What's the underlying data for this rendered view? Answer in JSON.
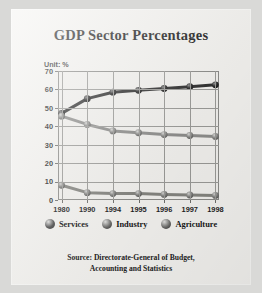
{
  "title": "GDP Sector Percentages",
  "unit_label": "Unit: %",
  "source_line1": "Source: Directorate-General of Budget,",
  "source_line2": "Accounting and Statistics",
  "colors": {
    "services": "#3a3a3a",
    "industry": "#9a9a98",
    "agriculture": "#8a8a88",
    "paper": "#f3f2ef",
    "frame": "#8b8b88",
    "grid": "#9a9a97",
    "text": "#1c1c1c"
  },
  "legend": [
    {
      "label": "Services",
      "color": "#4a4a4a",
      "marker": "sphere-marker"
    },
    {
      "label": "Industry",
      "color": "#6e6e6c",
      "marker": "sphere-marker"
    },
    {
      "label": "Agriculture",
      "color": "#6e6e6c",
      "marker": "sphere-marker"
    }
  ],
  "chart_data": {
    "type": "line",
    "title": "GDP Sector Percentages",
    "xlabel": "",
    "ylabel": "Unit: %",
    "categories": [
      "1980",
      "1990",
      "1994",
      "1995",
      "1996",
      "1997",
      "1998"
    ],
    "ylim": [
      0,
      70
    ],
    "yticks": [
      0,
      10,
      20,
      30,
      40,
      50,
      60,
      70
    ],
    "grid": true,
    "legend_position": "bottom",
    "series": [
      {
        "name": "Services",
        "values": [
          47.0,
          55.0,
          58.5,
          59.5,
          60.5,
          61.5,
          62.5
        ]
      },
      {
        "name": "Industry",
        "values": [
          45.5,
          41.0,
          37.5,
          36.5,
          35.5,
          35.0,
          34.5
        ]
      },
      {
        "name": "Agriculture",
        "values": [
          8.0,
          4.0,
          3.5,
          3.5,
          3.0,
          2.7,
          2.5
        ]
      }
    ]
  }
}
